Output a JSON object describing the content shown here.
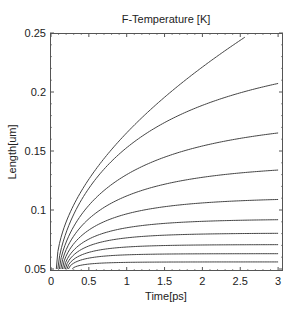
{
  "chart_data": {
    "type": "line",
    "title": "F-Temperature [K]",
    "xlabel": "Time[ps]",
    "ylabel": "Length[um]",
    "xlim": [
      0,
      3.07
    ],
    "ylim": [
      0.048,
      0.252
    ],
    "xticks": [
      0,
      0.5,
      1,
      1.5,
      2,
      2.5,
      3
    ],
    "xtick_labels": [
      "0",
      "0.5",
      "1",
      "1.5",
      "2",
      "2.5",
      "3"
    ],
    "yticks": [
      0.05,
      0.1,
      0.15,
      0.2,
      0.25
    ],
    "ytick_labels": [
      "0.05",
      "0.1",
      "0.15",
      "0.2",
      "0.25"
    ],
    "grid": false,
    "legend": "none",
    "line_color": "#444444",
    "x": [
      0.25,
      0.5,
      0.75,
      1,
      1.5,
      2,
      2.5,
      3
    ],
    "series": [
      {
        "name": "curve-1",
        "start": [
          0.07,
          0.05
        ],
        "values": [
          0.098,
          0.126,
          0.147,
          0.165,
          0.196,
          0.221,
          0.244,
          null
        ],
        "end": [
          2.56,
          0.247
        ],
        "model": {
          "kind": "power",
          "t0": 0.07,
          "B": 0.12,
          "p": 0.54,
          "tmax": 2.56
        }
      },
      {
        "name": "curve-2",
        "start": [
          0.09,
          0.05
        ],
        "values": [
          0.089,
          0.118,
          0.138,
          0.153,
          0.174,
          0.189,
          0.199,
          0.207
        ],
        "model": {
          "kind": "sat",
          "t0": 0.09,
          "Linf": 0.24,
          "tau": 1.3
        }
      },
      {
        "name": "curve-3",
        "start": [
          0.11,
          0.05
        ],
        "values": [
          0.08,
          0.104,
          0.119,
          0.13,
          0.145,
          0.154,
          0.161,
          0.165
        ],
        "model": {
          "kind": "sat",
          "t0": 0.11,
          "Linf": 0.18,
          "tau": 0.95
        }
      },
      {
        "name": "curve-4",
        "start": [
          0.13,
          0.05
        ],
        "values": [
          0.073,
          0.093,
          0.104,
          0.112,
          0.122,
          0.128,
          0.131,
          0.134
        ],
        "model": {
          "kind": "sat",
          "t0": 0.13,
          "Linf": 0.14,
          "tau": 0.7
        }
      },
      {
        "name": "curve-5",
        "start": [
          0.15,
          0.05
        ],
        "values": [
          0.067,
          0.083,
          0.091,
          0.097,
          0.103,
          0.106,
          0.108,
          0.109
        ],
        "model": {
          "kind": "sat",
          "t0": 0.15,
          "Linf": 0.111,
          "tau": 0.5
        }
      },
      {
        "name": "curve-6",
        "start": [
          0.17,
          0.05
        ],
        "values": [
          0.062,
          0.075,
          0.081,
          0.085,
          0.089,
          0.09,
          0.091,
          0.092
        ],
        "model": {
          "kind": "sat",
          "t0": 0.17,
          "Linf": 0.0925,
          "tau": 0.38
        }
      },
      {
        "name": "curve-7",
        "start": [
          0.19,
          0.05
        ],
        "values": [
          0.058,
          0.069,
          0.074,
          0.076,
          0.079,
          0.08,
          0.08,
          0.08
        ],
        "model": {
          "kind": "sat",
          "t0": 0.19,
          "Linf": 0.0805,
          "tau": 0.3
        }
      },
      {
        "name": "curve-8",
        "start": [
          0.21,
          0.05
        ],
        "values": [
          0.055,
          0.064,
          0.067,
          0.069,
          0.07,
          0.071,
          0.071,
          0.071
        ],
        "model": {
          "kind": "sat",
          "t0": 0.21,
          "Linf": 0.0707,
          "tau": 0.24
        }
      },
      {
        "name": "curve-9",
        "start": [
          0.23,
          0.05
        ],
        "values": [
          0.052,
          0.059,
          0.061,
          0.062,
          0.063,
          0.063,
          0.063,
          0.063
        ],
        "model": {
          "kind": "sat",
          "t0": 0.23,
          "Linf": 0.063,
          "tau": 0.2
        }
      },
      {
        "name": "curve-10",
        "start": [
          0.28,
          0.05
        ],
        "values": [
          null,
          0.054,
          0.055,
          0.056,
          0.056,
          0.056,
          0.056,
          0.056
        ],
        "model": {
          "kind": "sat",
          "t0": 0.28,
          "Linf": 0.056,
          "tau": 0.17
        }
      }
    ]
  }
}
